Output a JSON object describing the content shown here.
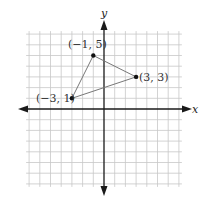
{
  "chart_data": {
    "type": "scatter",
    "title": "",
    "xlabel": "x",
    "ylabel": "y",
    "xlim": [
      -7,
      7
    ],
    "ylim": [
      -7,
      7
    ],
    "grid": true,
    "points": [
      {
        "x": -1,
        "y": 5,
        "label": "(−1, 5)"
      },
      {
        "x": 3,
        "y": 3,
        "label": "(3, 3)"
      },
      {
        "x": -3,
        "y": 1,
        "label": "(−3, 1)"
      }
    ],
    "polygon": {
      "shape": "triangle",
      "vertices": [
        [
          -1,
          5
        ],
        [
          3,
          3
        ],
        [
          -3,
          1
        ]
      ]
    }
  },
  "labels": {
    "x_axis": "x",
    "y_axis": "y",
    "p1": "(−1, 5)",
    "p2": "(3, 3)",
    "p3": "(−3, 1)"
  },
  "colors": {
    "grid": "#c8c8c8",
    "axis": "#1a1a1a",
    "triangle": "#777777",
    "point": "#111111"
  }
}
